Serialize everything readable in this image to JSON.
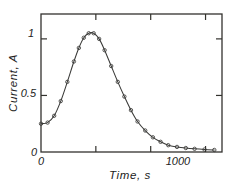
{
  "chart_data": {
    "type": "line",
    "title": "",
    "xlabel": "Time, s",
    "ylabel": "Current, A",
    "xlim": [
      0,
      1650
    ],
    "ylim": [
      0,
      1.22
    ],
    "grid": false,
    "legend": null,
    "x_ticks": [
      {
        "value": 0,
        "label": "0"
      },
      {
        "value": 500,
        "label": ""
      },
      {
        "value": 1000,
        "label": "1000"
      },
      {
        "value": 1500,
        "label": ""
      }
    ],
    "y_ticks": [
      {
        "value": 0,
        "label": "0"
      },
      {
        "value": 0.5,
        "label": "0.5"
      },
      {
        "value": 1.0,
        "label": "1"
      }
    ],
    "series": [
      {
        "name": "Current",
        "marker": "open-circle",
        "x": [
          0,
          60,
          120,
          180,
          240,
          300,
          345,
          390,
          435,
          480,
          530,
          580,
          640,
          700,
          760,
          820,
          880,
          950,
          1020,
          1090,
          1160,
          1240,
          1320,
          1400,
          1490,
          1580
        ],
        "y": [
          0.25,
          0.26,
          0.32,
          0.45,
          0.62,
          0.8,
          0.92,
          1.01,
          1.05,
          1.05,
          1.0,
          0.9,
          0.76,
          0.62,
          0.49,
          0.37,
          0.27,
          0.19,
          0.13,
          0.09,
          0.06,
          0.045,
          0.035,
          0.028,
          0.022,
          0.018
        ]
      }
    ]
  },
  "axis_labels": {
    "x_title": "Time, s",
    "y_title": "Current, A",
    "y_tick_1": "1",
    "y_tick_05": "0.5",
    "y_tick_0": "0",
    "x_tick_0": "0",
    "x_tick_1000": "1000"
  }
}
